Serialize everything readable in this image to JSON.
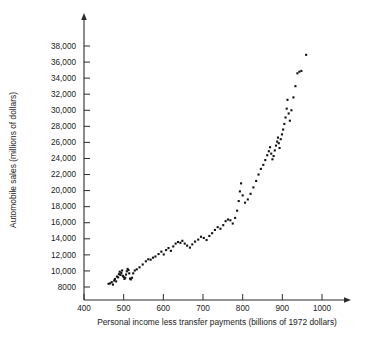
{
  "chart_data": {
    "type": "scatter",
    "title": "",
    "xlabel": "Personal income less transfer payments (billions of 1972 dollars)",
    "ylabel": "Automobile sales (millions of dollars)",
    "xlim": [
      345,
      1060
    ],
    "ylim": [
      6900,
      39500
    ],
    "grid": false,
    "legend": null,
    "xticks": [
      400,
      500,
      600,
      700,
      800,
      900,
      1000
    ],
    "xtick_labels": [
      "400",
      "500",
      "600",
      "700",
      "800",
      "900",
      "1000"
    ],
    "yticks": [
      8000,
      10000,
      12000,
      14000,
      16000,
      18000,
      20000,
      22000,
      24000,
      26000,
      28000,
      30000,
      32000,
      34000,
      36000,
      38000
    ],
    "ytick_labels": [
      "8000",
      "10,000",
      "12,000",
      "14,000",
      "16,000",
      "18,000",
      "20,000",
      "22,000",
      "24,000",
      "26,000",
      "28,000",
      "30,000",
      "32,000",
      "34,000",
      "36,000",
      "38,000"
    ],
    "marker_color": "#111111",
    "marker_size": 2.1,
    "points": [
      [
        462,
        8400
      ],
      [
        466,
        8450
      ],
      [
        470,
        8600
      ],
      [
        473,
        8300
      ],
      [
        476,
        8800
      ],
      [
        478,
        9000
      ],
      [
        481,
        8700
      ],
      [
        483,
        9300
      ],
      [
        486,
        9200
      ],
      [
        488,
        9600
      ],
      [
        490,
        9900
      ],
      [
        492,
        9500
      ],
      [
        494,
        9750
      ],
      [
        496,
        10050
      ],
      [
        498,
        9400
      ],
      [
        500,
        9250
      ],
      [
        502,
        9000
      ],
      [
        504,
        9150
      ],
      [
        506,
        9550
      ],
      [
        508,
        9950
      ],
      [
        510,
        10250
      ],
      [
        512,
        10100
      ],
      [
        514,
        9700
      ],
      [
        516,
        9050
      ],
      [
        518,
        8950
      ],
      [
        521,
        9150
      ],
      [
        524,
        9700
      ],
      [
        528,
        10050
      ],
      [
        533,
        10200
      ],
      [
        540,
        10450
      ],
      [
        548,
        10800
      ],
      [
        556,
        11200
      ],
      [
        562,
        11450
      ],
      [
        568,
        11400
      ],
      [
        574,
        11650
      ],
      [
        580,
        11800
      ],
      [
        588,
        12100
      ],
      [
        595,
        12400
      ],
      [
        601,
        12050
      ],
      [
        607,
        12600
      ],
      [
        613,
        12850
      ],
      [
        619,
        12500
      ],
      [
        625,
        13050
      ],
      [
        631,
        13400
      ],
      [
        637,
        13600
      ],
      [
        643,
        13500
      ],
      [
        648,
        13750
      ],
      [
        654,
        13400
      ],
      [
        660,
        13150
      ],
      [
        667,
        12900
      ],
      [
        673,
        13300
      ],
      [
        680,
        13650
      ],
      [
        688,
        13900
      ],
      [
        695,
        14250
      ],
      [
        702,
        14100
      ],
      [
        709,
        13850
      ],
      [
        716,
        14350
      ],
      [
        723,
        14700
      ],
      [
        730,
        15100
      ],
      [
        737,
        15450
      ],
      [
        744,
        15250
      ],
      [
        751,
        15700
      ],
      [
        757,
        16200
      ],
      [
        763,
        16400
      ],
      [
        769,
        16300
      ],
      [
        775,
        15900
      ],
      [
        781,
        16600
      ],
      [
        786,
        17500
      ],
      [
        790,
        18700
      ],
      [
        793,
        19900
      ],
      [
        796,
        20900
      ],
      [
        800,
        19400
      ],
      [
        806,
        18500
      ],
      [
        813,
        18900
      ],
      [
        820,
        19600
      ],
      [
        827,
        20400
      ],
      [
        834,
        21200
      ],
      [
        840,
        22000
      ],
      [
        846,
        22700
      ],
      [
        852,
        23200
      ],
      [
        857,
        23800
      ],
      [
        862,
        24400
      ],
      [
        866,
        24900
      ],
      [
        869,
        25400
      ],
      [
        872,
        24600
      ],
      [
        875,
        23900
      ],
      [
        878,
        24300
      ],
      [
        881,
        25000
      ],
      [
        884,
        25600
      ],
      [
        887,
        26100
      ],
      [
        889,
        26600
      ],
      [
        891,
        25900
      ],
      [
        893,
        25300
      ],
      [
        896,
        26400
      ],
      [
        899,
        27000
      ],
      [
        902,
        27600
      ],
      [
        905,
        28300
      ],
      [
        908,
        29100
      ],
      [
        911,
        30200
      ],
      [
        913,
        31300
      ],
      [
        916,
        29600
      ],
      [
        919,
        28700
      ],
      [
        923,
        30000
      ],
      [
        928,
        31600
      ],
      [
        933,
        33000
      ],
      [
        938,
        34600
      ],
      [
        943,
        34800
      ],
      [
        948,
        34900
      ],
      [
        960,
        36900
      ]
    ]
  }
}
